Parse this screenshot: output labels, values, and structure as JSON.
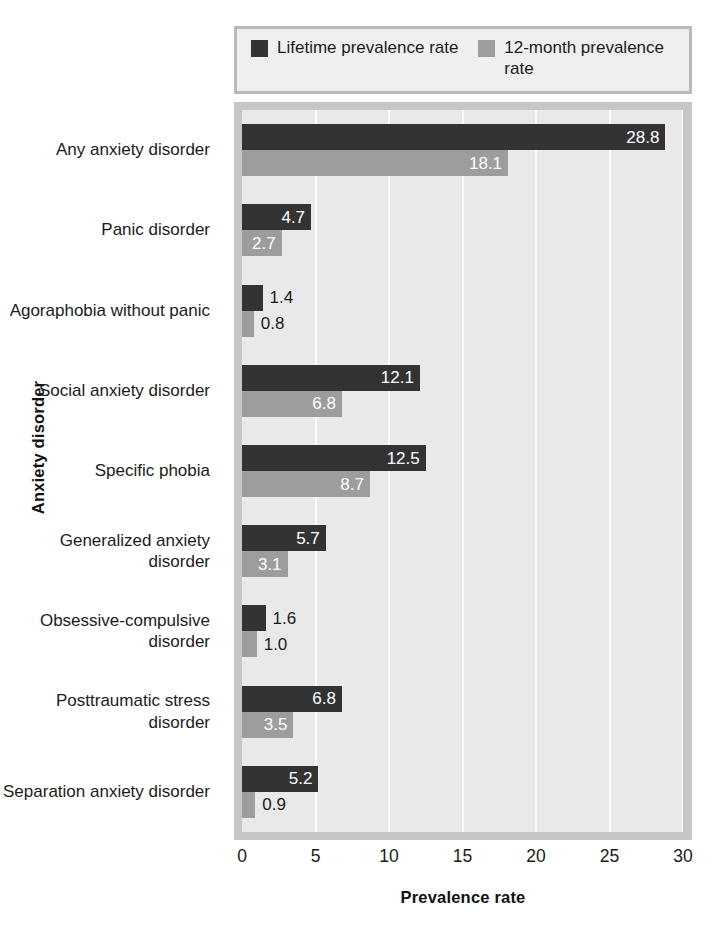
{
  "legend": {
    "entries": [
      {
        "label": "Lifetime prevalence rate",
        "color": "#333333",
        "icon": "legend-swatch-dark"
      },
      {
        "label": "12-month prevalence rate",
        "color": "#9d9d9d",
        "icon": "legend-swatch-gray"
      }
    ]
  },
  "axes": {
    "x_title": "Prevalence rate",
    "y_title": "Anxiety disorder",
    "x_ticks": [
      "0",
      "5",
      "10",
      "15",
      "20",
      "25",
      "30"
    ]
  },
  "chart_data": {
    "type": "bar",
    "orientation": "horizontal",
    "title": "",
    "xlabel": "Prevalence rate",
    "ylabel": "Anxiety disorder",
    "xlim": [
      0,
      30
    ],
    "xticks": [
      0,
      5,
      10,
      15,
      20,
      25,
      30
    ],
    "grid": "vertical-white-gridlines",
    "legend_position": "top",
    "categories": [
      "Any anxiety disorder",
      "Panic disorder",
      "Agoraphobia without panic",
      "Social anxiety disorder",
      "Specific phobia",
      "Generalized anxiety disorder",
      "Obsessive-compulsive disorder",
      "Posttraumatic stress disorder",
      "Separation anxiety disorder"
    ],
    "series": [
      {
        "name": "Lifetime prevalence rate",
        "color": "#333333",
        "values": [
          28.8,
          4.7,
          1.4,
          12.1,
          12.5,
          5.7,
          1.6,
          6.8,
          5.2
        ],
        "labels": [
          "28.8",
          "4.7",
          "1.4",
          "12.1",
          "12.5",
          "5.7",
          "1.6",
          "6.8",
          "5.2"
        ],
        "label_inside": [
          true,
          true,
          false,
          true,
          true,
          true,
          false,
          true,
          true
        ]
      },
      {
        "name": "12-month prevalence rate",
        "color": "#9d9d9d",
        "values": [
          18.1,
          2.7,
          0.8,
          6.8,
          8.7,
          3.1,
          1.0,
          3.5,
          0.9
        ],
        "labels": [
          "18.1",
          "2.7",
          "0.8",
          "6.8",
          "8.7",
          "3.1",
          "1.0",
          "3.5",
          "0.9"
        ],
        "label_inside": [
          true,
          true,
          false,
          true,
          true,
          true,
          false,
          true,
          false
        ]
      }
    ]
  }
}
